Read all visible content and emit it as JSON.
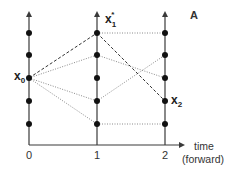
{
  "panel_label": "A",
  "axis": {
    "title_line1": "time",
    "title_line2": "(forward)",
    "ticks": [
      "0",
      "1",
      "2"
    ]
  },
  "labels": {
    "x0": {
      "base": "x",
      "sub": "0"
    },
    "x1_star": {
      "base": "x",
      "sub": "1",
      "sup": "*"
    },
    "x2": {
      "base": "x",
      "sub": "2"
    }
  },
  "states_per_time": 5,
  "time_columns": [
    0,
    1,
    2
  ],
  "state_levels": [
    1,
    2,
    3,
    4,
    5
  ],
  "transitions": [
    {
      "from": {
        "t": 0,
        "level": 3
      },
      "to": {
        "t": 1,
        "level": 5
      },
      "style": "dashed",
      "optimal": true
    },
    {
      "from": {
        "t": 0,
        "level": 3
      },
      "to": {
        "t": 1,
        "level": 4
      },
      "style": "dotted"
    },
    {
      "from": {
        "t": 0,
        "level": 3
      },
      "to": {
        "t": 1,
        "level": 2
      },
      "style": "dotted"
    },
    {
      "from": {
        "t": 0,
        "level": 3
      },
      "to": {
        "t": 1,
        "level": 1
      },
      "style": "dotted"
    },
    {
      "from": {
        "t": 1,
        "level": 5
      },
      "to": {
        "t": 2,
        "level": 5
      },
      "style": "dotted"
    },
    {
      "from": {
        "t": 1,
        "level": 5
      },
      "to": {
        "t": 2,
        "level": 2
      },
      "style": "dashed",
      "optimal": true
    },
    {
      "from": {
        "t": 1,
        "level": 4
      },
      "to": {
        "t": 2,
        "level": 3
      },
      "style": "dotted"
    },
    {
      "from": {
        "t": 1,
        "level": 2
      },
      "to": {
        "t": 2,
        "level": 4
      },
      "style": "dotted"
    },
    {
      "from": {
        "t": 1,
        "level": 1
      },
      "to": {
        "t": 2,
        "level": 1
      },
      "style": "dotted"
    }
  ],
  "colors": {
    "axis": "#3a3a3a",
    "dot": "#111111",
    "dashed": "#333333",
    "dotted": "#8a8a8a"
  }
}
